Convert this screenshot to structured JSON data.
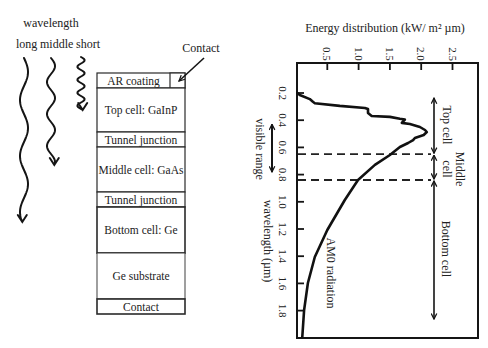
{
  "diagram": {
    "wavelength_title": "wavelength",
    "wave_labels": {
      "long": "long",
      "middle": "middle",
      "short": "short"
    },
    "contact_callout": "Contact",
    "layers": [
      {
        "label": "AR coating"
      },
      {
        "label": "Top cell: GaInP"
      },
      {
        "label": "Tunnel junction"
      },
      {
        "label": "Middle cell: GaAs"
      },
      {
        "label": "Tunnel junction"
      },
      {
        "label": "Bottom cell: Ge"
      },
      {
        "label": "Ge substrate"
      },
      {
        "label": "Contact"
      }
    ]
  },
  "chart_data": {
    "type": "line",
    "title": "",
    "xlabel": "Energy distribution (kW/ m² µm)",
    "ylabel": "wavelength (µm)",
    "axes_orientation": "rotated: energy on top horizontal axis, wavelength on vertical axis increasing downward",
    "xlim": [
      0,
      2.9
    ],
    "ylim": [
      0,
      2.0
    ],
    "x_ticks": [
      0.5,
      1.0,
      1.5,
      2.0,
      2.5
    ],
    "x_tick_labels": [
      "0.5",
      "1.0",
      "1.5",
      "2.0",
      "2.5"
    ],
    "y_ticks": [
      0.2,
      0.4,
      0.6,
      0.8,
      1.0,
      1.2,
      1.4,
      1.6,
      1.8
    ],
    "y_tick_labels": [
      "0.2",
      "0.4",
      "0.6",
      "0.8",
      "1.0",
      "1.2",
      "1.4",
      "1.6",
      "1.8"
    ],
    "grid": false,
    "legend": null,
    "series": [
      {
        "name": "AM0 radiation",
        "wavelength_um": [
          0.2,
          0.215,
          0.245,
          0.265,
          0.275,
          0.295,
          0.31,
          0.318,
          0.347,
          0.369,
          0.376,
          0.39,
          0.395,
          0.42,
          0.428,
          0.45,
          0.472,
          0.487,
          0.509,
          0.531,
          0.546,
          0.568,
          0.597,
          0.656,
          0.729,
          0.84,
          0.987,
          1.207,
          1.406,
          1.597,
          1.796,
          1.994
        ],
        "energy_kW_m2_um": [
          0.02,
          0.06,
          0.22,
          0.27,
          0.3,
          0.7,
          1.1,
          1.15,
          1.15,
          1.21,
          1.5,
          1.66,
          1.74,
          1.69,
          1.82,
          1.98,
          2.06,
          2.09,
          2.04,
          1.9,
          1.87,
          1.79,
          1.66,
          1.5,
          1.26,
          0.99,
          0.78,
          0.5,
          0.3,
          0.19,
          0.13,
          0.1
        ]
      }
    ],
    "dashed_boundaries_um": [
      0.65,
      0.84
    ],
    "cell_ranges": [
      {
        "label": "Top cell",
        "from_um": 0.23,
        "to_um": 0.65
      },
      {
        "label": "Middle cell",
        "label_lines": [
          "Middle",
          "cell"
        ],
        "from_um": 0.65,
        "to_um": 0.84
      },
      {
        "label": "Bottom cell",
        "from_um": 0.84,
        "to_um": 1.87
      }
    ],
    "visible_range": {
      "label": "visible range",
      "from_um": 0.43,
      "to_um": 0.78
    },
    "annotations": [
      {
        "text": "AM0 radiation",
        "near_wavelength_um": 1.4
      }
    ]
  }
}
